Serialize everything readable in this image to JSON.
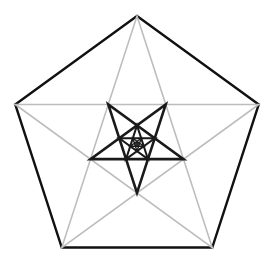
{
  "figure": {
    "center": [
      137,
      144
    ],
    "outer_radius": 128,
    "levels": 4,
    "ratio": 0.381966,
    "colors": {
      "pentagon": "#111111",
      "gray_star": "#bdbdbd",
      "inner_star": "#1a1a1a",
      "background": "#ffffff"
    },
    "stroke_widths": {
      "pentagon": 2.4,
      "gray_star": 1.6,
      "inner_star": [
        2.6,
        2.0,
        1.4,
        1.0
      ]
    }
  }
}
